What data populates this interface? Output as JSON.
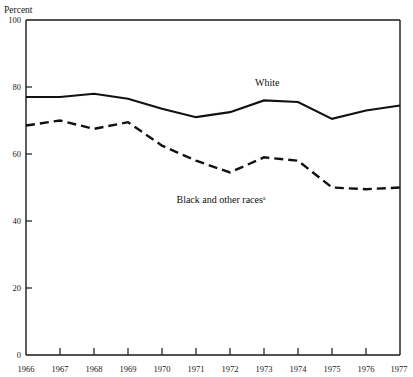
{
  "chart_data": {
    "type": "line",
    "title": "",
    "ylabel": "Percent",
    "xlabel": "",
    "ylim": [
      0,
      100
    ],
    "yticks": [
      0,
      20,
      40,
      60,
      80,
      100
    ],
    "xlim": [
      1966,
      1977
    ],
    "grid": false,
    "legend_position": "inline-annotation",
    "categories": [
      1966,
      1967,
      1968,
      1969,
      1970,
      1971,
      1972,
      1973,
      1974,
      1975,
      1976,
      1977
    ],
    "x": [
      "1966",
      "1967",
      "1968",
      "1969",
      "1970",
      "1971",
      "1972",
      "1973",
      "1974",
      "1975",
      "1976",
      "1977"
    ],
    "series": [
      {
        "name": "White",
        "style": "solid",
        "label": "White",
        "values": [
          77.0,
          77.0,
          78.0,
          76.5,
          73.5,
          71.0,
          72.5,
          76.0,
          75.5,
          70.5,
          73.0,
          74.5
        ]
      },
      {
        "name": "Black and other races",
        "style": "dashed",
        "label": "Black and other races",
        "footnote_marker": "a",
        "values": [
          68.5,
          70.0,
          67.5,
          69.5,
          62.5,
          58.0,
          54.5,
          59.0,
          58.0,
          50.0,
          49.5,
          50.0
        ]
      }
    ],
    "annotations": [
      {
        "text": "White",
        "x": 1973.2,
        "y": 86.5
      },
      {
        "text": "Black and other races",
        "footnote_marker": "a",
        "x": 1969.6,
        "y": 46.5
      }
    ]
  },
  "axis": {
    "y_title": "Percent",
    "y_tick_labels": [
      "100",
      "80",
      "60",
      "40",
      "20",
      "0"
    ],
    "x_tick_labels": [
      "1966",
      "1967",
      "1968",
      "1969",
      "1970",
      "1971",
      "1972",
      "1973",
      "1974",
      "1975",
      "1976",
      "1977"
    ]
  },
  "colors": {
    "ink": "#111111",
    "background": "#ffffff"
  }
}
